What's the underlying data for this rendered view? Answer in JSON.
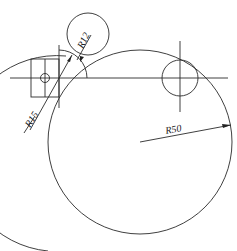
{
  "drawing": {
    "labels": {
      "r12": "R12",
      "r15": "R15",
      "r50": "R50"
    },
    "line_color": "#2a2a2a",
    "background": "#ffffff"
  }
}
